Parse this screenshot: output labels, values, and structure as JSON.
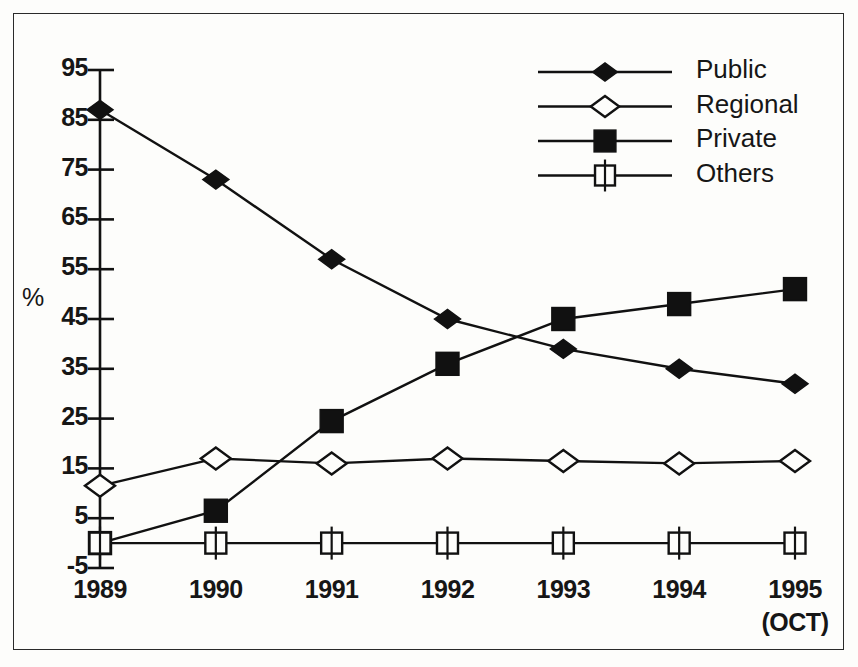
{
  "chart_data": {
    "type": "line",
    "title": "",
    "subtitle": "",
    "xlabel": "",
    "ylabel": "%",
    "categories": [
      "1989",
      "1990",
      "1991",
      "1992",
      "1993",
      "1994",
      "1995"
    ],
    "x_note": "(OCT)",
    "x_note_category": "1995",
    "ylim": [
      -5,
      95
    ],
    "yticks": [
      -5,
      5,
      15,
      25,
      35,
      45,
      55,
      65,
      75,
      85,
      95
    ],
    "ytick_labels": [
      "-5",
      "5",
      "15",
      "25",
      "35",
      "45",
      "55",
      "65",
      "75",
      "85",
      "95"
    ],
    "grid": false,
    "legend_position": "top-right",
    "series": [
      {
        "name": "Public",
        "marker": "filled-diamond",
        "color": "#111111",
        "values": [
          87,
          73,
          57,
          45,
          39,
          35,
          32
        ]
      },
      {
        "name": "Regional",
        "marker": "open-diamond",
        "color": "#111111",
        "values": [
          11.5,
          17,
          16,
          17,
          16.5,
          16,
          16.5
        ]
      },
      {
        "name": "Private",
        "marker": "filled-square",
        "color": "#111111",
        "values": [
          0,
          6.5,
          24.5,
          36,
          45,
          48,
          51
        ]
      },
      {
        "name": "Others",
        "marker": "open-square",
        "color": "#111111",
        "values": [
          0,
          0,
          0,
          0,
          0,
          0,
          0
        ]
      }
    ]
  },
  "legend": {
    "items": [
      {
        "label": "Public"
      },
      {
        "label": "Regional"
      },
      {
        "label": "Private"
      },
      {
        "label": "Others"
      }
    ]
  },
  "axis": {
    "y_title": "%"
  },
  "style": {
    "line_color": "#111111",
    "frame_color": "#2a2a2a",
    "background": "#fdfdfb"
  }
}
